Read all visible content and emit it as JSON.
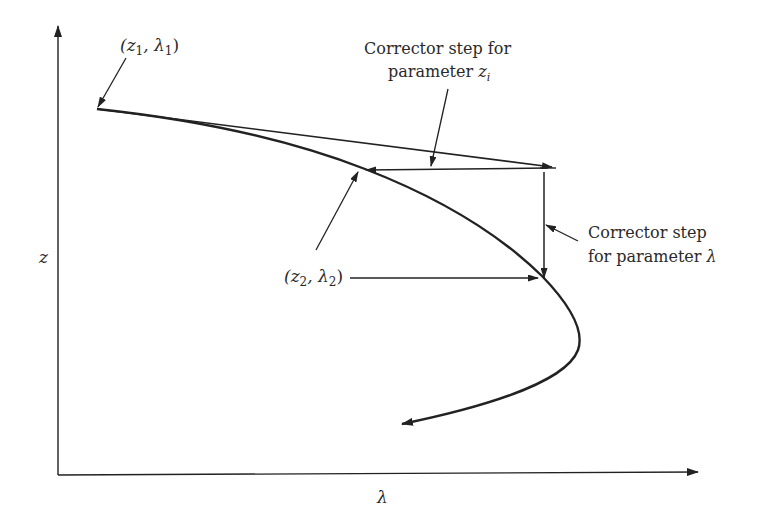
{
  "figure": {
    "type": "predictor-corrector continuation diagram",
    "axes": {
      "x_label": "λ",
      "y_label": "z"
    },
    "points": {
      "start": {
        "label_prefix": "(z",
        "sub1": "1",
        "mid": ", λ",
        "sub2": "1",
        "suffix": ")"
      },
      "corrected": {
        "label_prefix": "(z",
        "sub1": "2",
        "mid": ", λ",
        "sub2": "2",
        "suffix": ")"
      }
    },
    "annotations": {
      "corrector_z": {
        "line1": "Corrector step for",
        "line2_text": "parameter ",
        "line2_var": "z",
        "line2_sub": "i"
      },
      "corrector_lambda": {
        "line1": "Corrector step",
        "line2_text": "for parameter ",
        "line2_var": "λ"
      }
    },
    "colors": {
      "ink": "#222222",
      "background": "#ffffff"
    }
  }
}
